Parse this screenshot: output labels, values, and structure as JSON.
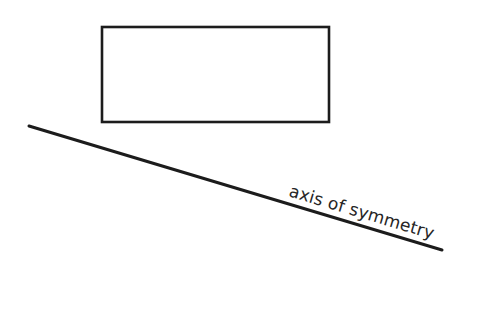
{
  "canvas": {
    "width": 481,
    "height": 309,
    "background_color": "#ffffff",
    "ink_color": "#1c1c1c",
    "text_color": "#262626"
  },
  "diagram": {
    "shapes": {
      "rectangle": {
        "name": "rectangle",
        "x": 102,
        "y": 27,
        "width": 227,
        "height": 95,
        "stroke_width": 2.6,
        "fill": "none"
      },
      "axis_line": {
        "name": "axis of symmetry line",
        "x1": 29,
        "y1": 126,
        "x2": 442,
        "y2": 250,
        "stroke_width": 3,
        "angle_degrees": 16.7
      }
    },
    "labels": {
      "axis_of_symmetry": {
        "text": "axis of symmetry",
        "x": 288,
        "y": 196,
        "rotation_degrees": 16.7,
        "font_size": 17
      }
    }
  }
}
